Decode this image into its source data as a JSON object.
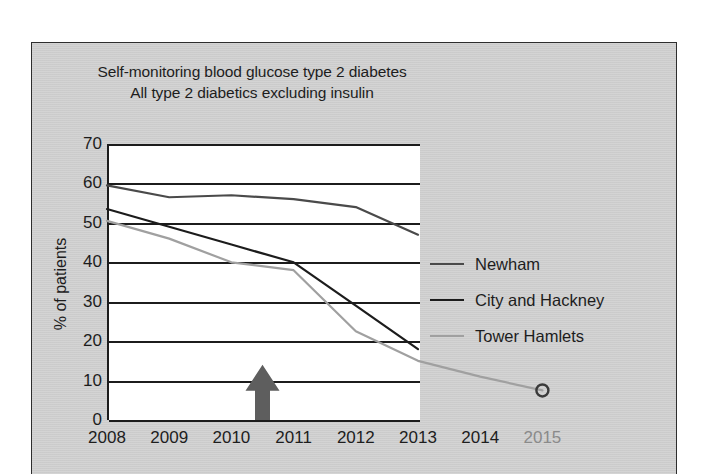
{
  "figure": {
    "title_line1": "Self-monitoring blood glucose type 2 diabetes",
    "title_line2": "All type 2 diabetics excluding insulin"
  },
  "axes": {
    "ylabel": "% of patients",
    "yticks": [
      "70",
      "60",
      "50",
      "40",
      "30",
      "20",
      "10",
      "0"
    ],
    "xticks": [
      "2008",
      "2009",
      "2010",
      "2011",
      "2012",
      "2013",
      "2014",
      "2015"
    ]
  },
  "legend": {
    "items": [
      {
        "label": "Newham",
        "color": "#4a4a4a"
      },
      {
        "label": "City and Hackney",
        "color": "#1c1c1c"
      },
      {
        "label": "Tower Hamlets",
        "color": "#a0a0a0"
      }
    ]
  },
  "annotation": {
    "arrow_name": "up-arrow-marker",
    "arrow_year": "2010.5",
    "arrow_color": "#5e5e5e",
    "arrow_top_value": 14
  },
  "colors": {
    "panel_background": "#d2d2d2",
    "plot_background": "#ffffff",
    "axis": "#1c1c1c",
    "text": "#1d1d1d",
    "muted_text": "#8a8a8a"
  },
  "chart_data": {
    "type": "line",
    "xlabel": "",
    "ylabel": "% of patients",
    "x": [
      2008,
      2009,
      2010,
      2011,
      2012,
      2013,
      2014,
      2015
    ],
    "xlim": [
      2008,
      2015
    ],
    "ylim": [
      0,
      70
    ],
    "ytick_step": 10,
    "grid": true,
    "legend_position": "right",
    "series": [
      {
        "name": "Newham",
        "color": "#4a4a4a",
        "x": [
          2008,
          2009,
          2010,
          2011,
          2012,
          2013
        ],
        "values": [
          59.5,
          56.5,
          57,
          56,
          54,
          47
        ]
      },
      {
        "name": "City and Hackney",
        "color": "#1c1c1c",
        "x": [
          2008,
          2009,
          2010,
          2011,
          2012,
          2013
        ],
        "values": [
          53.5,
          49,
          44.5,
          40,
          29,
          18
        ]
      },
      {
        "name": "Tower Hamlets",
        "color": "#a0a0a0",
        "x": [
          2008,
          2009,
          2010,
          2011,
          2012,
          2013,
          2014,
          2015
        ],
        "values": [
          50.5,
          46,
          40,
          38,
          22.5,
          15,
          11,
          7.5
        ],
        "end_marker": {
          "type": "circle",
          "x": 2015,
          "y": 7.5
        }
      }
    ],
    "annotations": [
      {
        "type": "arrow",
        "direction": "up",
        "x": 2010.5,
        "y_from": 0,
        "y_to": 14,
        "color": "#5e5e5e"
      }
    ]
  }
}
